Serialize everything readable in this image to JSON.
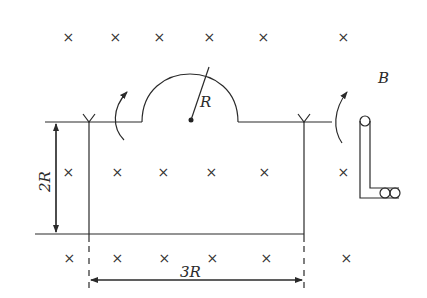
{
  "diagram": {
    "field_label": "B",
    "radius_label": "R",
    "height_label": "2R",
    "width_label": "3R",
    "field_symbol": "×",
    "field_direction": "into-page",
    "rotation_arrows": [
      "left-rotation-arrow",
      "right-rotation-arrow"
    ],
    "cross_rows": [
      {
        "row": "top",
        "count": 6
      },
      {
        "row": "middle",
        "count": 6
      },
      {
        "row": "bottom",
        "count": 6
      }
    ]
  }
}
